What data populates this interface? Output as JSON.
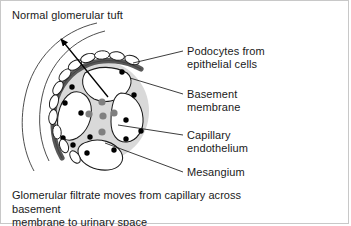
{
  "panel": {
    "title": "Normal glomerular tuft",
    "border_color": "#c8c8c8",
    "background": "#ffffff"
  },
  "labels": {
    "podocytes": {
      "line1": "Podocytes from",
      "line2": "epithelial cells"
    },
    "basement": {
      "line1": "Basement",
      "line2": "membrane"
    },
    "capillary": {
      "line1": "Capillary",
      "line2": "endothelium"
    },
    "mesangium": {
      "line1": "Mesangium",
      "line2": ""
    }
  },
  "caption": {
    "line1": "Glomerular filtrate moves from capillary across basement",
    "line2": "membrane to urinary space"
  },
  "diagram": {
    "name": "glomerular-tuft-cross-section",
    "colors": {
      "tuft_body": "#d9d9d9",
      "basement_membrane": "#595959",
      "mesangial_cell": "#808080",
      "endothelial_dot": "#000000",
      "capillary_lumen": "#ffffff",
      "outline": "#1a1a1a",
      "bowman_capsule": "#3a3a3a"
    },
    "tuft": {
      "cx": 100,
      "cy": 110,
      "r": 48
    },
    "mesangial_cells": [
      {
        "cx": 101,
        "cy": 101,
        "r": 3.6
      },
      {
        "cx": 88,
        "cy": 113,
        "r": 3.6
      },
      {
        "cx": 102,
        "cy": 115,
        "r": 3.6
      },
      {
        "cx": 113,
        "cy": 112,
        "r": 3.6
      },
      {
        "cx": 101,
        "cy": 131,
        "r": 3.6
      }
    ],
    "endothelial_dots": [
      {
        "cx": 71,
        "cy": 86
      },
      {
        "cx": 121,
        "cy": 71
      },
      {
        "cx": 64,
        "cy": 102
      },
      {
        "cx": 133,
        "cy": 94
      },
      {
        "cx": 80,
        "cy": 112
      },
      {
        "cx": 125,
        "cy": 119
      },
      {
        "cx": 62,
        "cy": 137
      },
      {
        "cx": 140,
        "cy": 130
      },
      {
        "cx": 72,
        "cy": 144
      },
      {
        "cx": 125,
        "cy": 138
      },
      {
        "cx": 89,
        "cy": 136
      },
      {
        "cx": 113,
        "cy": 149
      },
      {
        "cx": 86,
        "cy": 152
      }
    ],
    "podocytes": [
      {
        "cx": 52,
        "cy": 116,
        "rx": 4.2,
        "ry": 7.5,
        "rot": 8
      },
      {
        "cx": 53,
        "cy": 101,
        "rx": 4.2,
        "ry": 7.5,
        "rot": 18
      },
      {
        "cx": 57,
        "cy": 87,
        "rx": 4.2,
        "ry": 7.5,
        "rot": 30
      },
      {
        "cx": 64,
        "cy": 74,
        "rx": 4.2,
        "ry": 7.5,
        "rot": 44
      },
      {
        "cx": 74,
        "cy": 64,
        "rx": 4.2,
        "ry": 7.5,
        "rot": 58
      },
      {
        "cx": 87,
        "cy": 57,
        "rx": 4.2,
        "ry": 7.5,
        "rot": 72
      },
      {
        "cx": 101,
        "cy": 54,
        "rx": 4.2,
        "ry": 7.5,
        "rot": 86
      },
      {
        "cx": 116,
        "cy": 55,
        "rx": 4.2,
        "ry": 7.5,
        "rot": 98
      },
      {
        "cx": 131,
        "cy": 59,
        "rx": 4.2,
        "ry": 7.5,
        "rot": 110
      },
      {
        "cx": 56,
        "cy": 131,
        "rx": 4.2,
        "ry": 7.0,
        "rot": 355
      },
      {
        "cx": 63,
        "cy": 145,
        "rx": 4.2,
        "ry": 7.0,
        "rot": 340
      },
      {
        "cx": 74,
        "cy": 156,
        "rx": 4.2,
        "ry": 7.0,
        "rot": 325
      }
    ],
    "leader_lines": [
      {
        "name": "leader-podocytes",
        "x1": 132,
        "y1": 62,
        "x2": 182,
        "y2": 50
      },
      {
        "name": "leader-basement",
        "x1": 129,
        "y1": 77,
        "x2": 182,
        "y2": 93
      },
      {
        "name": "leader-capillary",
        "x1": 117,
        "y1": 124,
        "x2": 182,
        "y2": 134
      },
      {
        "name": "leader-mesangium",
        "x1": 104,
        "y1": 142,
        "x2": 182,
        "y2": 171
      }
    ],
    "arrow": {
      "x1": 107,
      "y1": 96,
      "x2": 60,
      "y2": 38
    }
  }
}
